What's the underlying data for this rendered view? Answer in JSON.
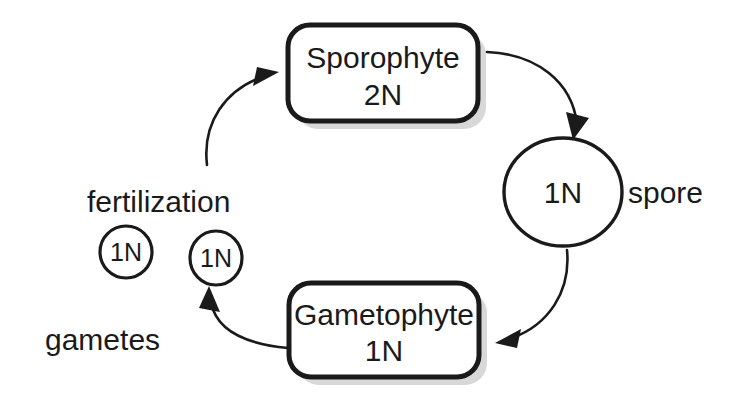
{
  "diagram": {
    "background_color": "#ffffff",
    "ink_color": "#1a1a1a",
    "nodes": {
      "sporophyte": {
        "label": "Sporophyte",
        "ploidy": "2N",
        "shape": "rounded-rectangle"
      },
      "gametophyte": {
        "label": "Gametophyte",
        "ploidy": "1N",
        "shape": "rounded-rectangle"
      },
      "spore": {
        "ploidy": "1N",
        "label": "spore",
        "shape": "circle"
      },
      "gamete_left": {
        "ploidy": "1N",
        "shape": "circle"
      },
      "gamete_right": {
        "ploidy": "1N",
        "shape": "circle"
      }
    },
    "labels": {
      "fertilization": "fertilization",
      "gametes": "gametes",
      "spore": "spore"
    },
    "arrows": [
      {
        "name": "sporophyte-to-spore",
        "from": "sporophyte",
        "to": "spore",
        "direction": "clockwise"
      },
      {
        "name": "spore-to-gametophyte",
        "from": "spore",
        "to": "gametophyte",
        "direction": "clockwise"
      },
      {
        "name": "gametophyte-to-gamete",
        "from": "gametophyte",
        "to": "gamete_right",
        "direction": "clockwise"
      },
      {
        "name": "fertilization-to-sporophyte",
        "from": "gametes",
        "to": "sporophyte",
        "direction": "clockwise"
      }
    ]
  }
}
